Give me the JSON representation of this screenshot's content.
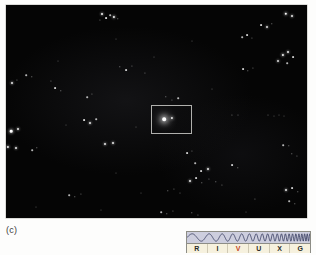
{
  "panel": {
    "label": "(c)",
    "caption_letter": "c"
  },
  "sky_image": {
    "background_color": "#050505",
    "frame_color": "#b9b9b4",
    "width": 301,
    "height": 213,
    "stars": [
      {
        "x": 96,
        "y": 9,
        "r": 1.0,
        "o": 0.95
      },
      {
        "x": 100,
        "y": 13,
        "r": 0.9,
        "o": 0.85
      },
      {
        "x": 104,
        "y": 10,
        "r": 0.8,
        "o": 0.7
      },
      {
        "x": 108,
        "y": 12,
        "r": 1.1,
        "o": 0.95
      },
      {
        "x": 112,
        "y": 14,
        "r": 0.7,
        "o": 0.6
      },
      {
        "x": 94,
        "y": 15,
        "r": 0.6,
        "o": 0.5
      },
      {
        "x": 280,
        "y": 9,
        "r": 1.2,
        "o": 1.0
      },
      {
        "x": 286,
        "y": 11,
        "r": 1.0,
        "o": 0.9
      },
      {
        "x": 255,
        "y": 20,
        "r": 0.9,
        "o": 0.8
      },
      {
        "x": 261,
        "y": 22,
        "r": 1.0,
        "o": 0.85
      },
      {
        "x": 266,
        "y": 19,
        "r": 0.7,
        "o": 0.6
      },
      {
        "x": 236,
        "y": 32,
        "r": 0.8,
        "o": 0.7
      },
      {
        "x": 241,
        "y": 30,
        "r": 0.9,
        "o": 0.8
      },
      {
        "x": 246,
        "y": 33,
        "r": 0.6,
        "o": 0.5
      },
      {
        "x": 277,
        "y": 50,
        "r": 1.1,
        "o": 0.95
      },
      {
        "x": 282,
        "y": 47,
        "r": 1.0,
        "o": 0.9
      },
      {
        "x": 287,
        "y": 52,
        "r": 0.9,
        "o": 0.8
      },
      {
        "x": 272,
        "y": 56,
        "r": 1.0,
        "o": 0.85
      },
      {
        "x": 281,
        "y": 58,
        "r": 0.8,
        "o": 0.7
      },
      {
        "x": 237,
        "y": 64,
        "r": 0.9,
        "o": 0.8
      },
      {
        "x": 242,
        "y": 66,
        "r": 0.7,
        "o": 0.6
      },
      {
        "x": 247,
        "y": 63,
        "r": 0.6,
        "o": 0.5
      },
      {
        "x": 110,
        "y": 34,
        "r": 0.5,
        "o": 0.4
      },
      {
        "x": 186,
        "y": 36,
        "r": 0.5,
        "o": 0.4
      },
      {
        "x": 6,
        "y": 78,
        "r": 1.0,
        "o": 0.9
      },
      {
        "x": 11,
        "y": 75,
        "r": 0.6,
        "o": 0.5
      },
      {
        "x": 20,
        "y": 70,
        "r": 0.8,
        "o": 0.7
      },
      {
        "x": 26,
        "y": 72,
        "r": 0.7,
        "o": 0.6
      },
      {
        "x": 45,
        "y": 76,
        "r": 0.6,
        "o": 0.5
      },
      {
        "x": 114,
        "y": 62,
        "r": 0.7,
        "o": 0.6
      },
      {
        "x": 120,
        "y": 65,
        "r": 0.9,
        "o": 0.8
      },
      {
        "x": 126,
        "y": 61,
        "r": 0.6,
        "o": 0.5
      },
      {
        "x": 139,
        "y": 68,
        "r": 0.6,
        "o": 0.5
      },
      {
        "x": 49,
        "y": 83,
        "r": 0.9,
        "o": 0.8
      },
      {
        "x": 55,
        "y": 86,
        "r": 0.7,
        "o": 0.6
      },
      {
        "x": 81,
        "y": 92,
        "r": 0.8,
        "o": 0.7
      },
      {
        "x": 86,
        "y": 89,
        "r": 0.6,
        "o": 0.5
      },
      {
        "x": 160,
        "y": 92,
        "r": 0.7,
        "o": 0.6
      },
      {
        "x": 166,
        "y": 95,
        "r": 0.6,
        "o": 0.5
      },
      {
        "x": 172,
        "y": 93,
        "r": 0.8,
        "o": 0.7
      },
      {
        "x": 226,
        "y": 110,
        "r": 0.6,
        "o": 0.5
      },
      {
        "x": 232,
        "y": 110,
        "r": 0.5,
        "o": 0.45
      },
      {
        "x": 262,
        "y": 110,
        "r": 0.5,
        "o": 0.45
      },
      {
        "x": 268,
        "y": 111,
        "r": 0.5,
        "o": 0.4
      },
      {
        "x": 273,
        "y": 110,
        "r": 0.5,
        "o": 0.4
      },
      {
        "x": 278,
        "y": 111,
        "r": 0.5,
        "o": 0.4
      },
      {
        "x": 78,
        "y": 115,
        "r": 0.9,
        "o": 0.85
      },
      {
        "x": 84,
        "y": 118,
        "r": 1.0,
        "o": 0.9
      },
      {
        "x": 90,
        "y": 114,
        "r": 0.8,
        "o": 0.7
      },
      {
        "x": 5,
        "y": 126,
        "r": 1.3,
        "o": 1.0
      },
      {
        "x": 12,
        "y": 124,
        "r": 1.0,
        "o": 0.9
      },
      {
        "x": 2,
        "y": 142,
        "r": 1.1,
        "o": 0.95
      },
      {
        "x": 10,
        "y": 143,
        "r": 1.0,
        "o": 0.9
      },
      {
        "x": 26,
        "y": 145,
        "r": 0.8,
        "o": 0.7
      },
      {
        "x": 31,
        "y": 143,
        "r": 0.7,
        "o": 0.6
      },
      {
        "x": 99,
        "y": 139,
        "r": 1.0,
        "o": 0.9
      },
      {
        "x": 107,
        "y": 138,
        "r": 1.0,
        "o": 0.9
      },
      {
        "x": 181,
        "y": 148,
        "r": 0.9,
        "o": 0.8
      },
      {
        "x": 186,
        "y": 146,
        "r": 0.6,
        "o": 0.5
      },
      {
        "x": 277,
        "y": 140,
        "r": 0.8,
        "o": 0.7
      },
      {
        "x": 283,
        "y": 141,
        "r": 0.7,
        "o": 0.6
      },
      {
        "x": 189,
        "y": 158,
        "r": 0.8,
        "o": 0.7
      },
      {
        "x": 110,
        "y": 168,
        "r": 0.5,
        "o": 0.4
      },
      {
        "x": 195,
        "y": 166,
        "r": 0.9,
        "o": 0.8
      },
      {
        "x": 202,
        "y": 164,
        "r": 1.0,
        "o": 0.9
      },
      {
        "x": 226,
        "y": 160,
        "r": 0.9,
        "o": 0.8
      },
      {
        "x": 232,
        "y": 163,
        "r": 0.7,
        "o": 0.6
      },
      {
        "x": 286,
        "y": 149,
        "r": 0.7,
        "o": 0.6
      },
      {
        "x": 291,
        "y": 151,
        "r": 0.6,
        "o": 0.5
      },
      {
        "x": 184,
        "y": 176,
        "r": 1.0,
        "o": 0.9
      },
      {
        "x": 190,
        "y": 173,
        "r": 0.9,
        "o": 0.8
      },
      {
        "x": 196,
        "y": 178,
        "r": 0.7,
        "o": 0.6
      },
      {
        "x": 203,
        "y": 174,
        "r": 0.6,
        "o": 0.5
      },
      {
        "x": 210,
        "y": 177,
        "r": 0.7,
        "o": 0.6
      },
      {
        "x": 216,
        "y": 180,
        "r": 0.6,
        "o": 0.5
      },
      {
        "x": 162,
        "y": 186,
        "r": 0.7,
        "o": 0.6
      },
      {
        "x": 168,
        "y": 184,
        "r": 0.6,
        "o": 0.5
      },
      {
        "x": 174,
        "y": 188,
        "r": 0.5,
        "o": 0.45
      },
      {
        "x": 63,
        "y": 190,
        "r": 0.8,
        "o": 0.7
      },
      {
        "x": 69,
        "y": 192,
        "r": 0.7,
        "o": 0.6
      },
      {
        "x": 75,
        "y": 189,
        "r": 0.6,
        "o": 0.5
      },
      {
        "x": 135,
        "y": 188,
        "r": 0.5,
        "o": 0.4
      },
      {
        "x": 249,
        "y": 194,
        "r": 0.6,
        "o": 0.5
      },
      {
        "x": 280,
        "y": 185,
        "r": 1.0,
        "o": 0.9
      },
      {
        "x": 286,
        "y": 183,
        "r": 0.9,
        "o": 0.8
      },
      {
        "x": 292,
        "y": 187,
        "r": 0.7,
        "o": 0.6
      },
      {
        "x": 283,
        "y": 196,
        "r": 0.8,
        "o": 0.7
      },
      {
        "x": 289,
        "y": 199,
        "r": 0.7,
        "o": 0.6
      },
      {
        "x": 155,
        "y": 207,
        "r": 0.8,
        "o": 0.7
      },
      {
        "x": 161,
        "y": 209,
        "r": 0.7,
        "o": 0.6
      },
      {
        "x": 167,
        "y": 206,
        "r": 0.6,
        "o": 0.5
      },
      {
        "x": 186,
        "y": 208,
        "r": 0.7,
        "o": 0.6
      },
      {
        "x": 192,
        "y": 210,
        "r": 0.6,
        "o": 0.5
      },
      {
        "x": 30,
        "y": 202,
        "r": 0.5,
        "o": 0.4
      },
      {
        "x": 95,
        "y": 205,
        "r": 0.5,
        "o": 0.4
      },
      {
        "x": 240,
        "y": 207,
        "r": 0.5,
        "o": 0.4
      },
      {
        "x": 52,
        "y": 56,
        "r": 0.5,
        "o": 0.4
      },
      {
        "x": 148,
        "y": 52,
        "r": 0.5,
        "o": 0.4
      },
      {
        "x": 206,
        "y": 84,
        "r": 0.5,
        "o": 0.4
      },
      {
        "x": 60,
        "y": 120,
        "r": 0.5,
        "o": 0.4
      },
      {
        "x": 130,
        "y": 122,
        "r": 0.5,
        "o": 0.4
      }
    ],
    "inset_sources": [
      {
        "x": 158,
        "y": 114,
        "r": 1.8,
        "o": 1.0,
        "glow": true
      },
      {
        "x": 166,
        "y": 113,
        "r": 1.1,
        "o": 0.9,
        "glow": false
      }
    ]
  },
  "highlight_box": {
    "left": 151,
    "top": 105,
    "width": 41,
    "height": 29,
    "border_color": "#b0b0ad"
  },
  "spectrum_legend": {
    "wave_band_color": "#cdcede",
    "wave_color": "#2a2f55",
    "label_strip_color": "#f6f1de",
    "border_color": "#8d8d86",
    "highlight_color": "#c4441c",
    "bands": [
      {
        "code": "R",
        "name": "radio",
        "highlighted": false
      },
      {
        "code": "I",
        "name": "infrared",
        "highlighted": false
      },
      {
        "code": "V",
        "name": "visible",
        "highlighted": true
      },
      {
        "code": "U",
        "name": "ultraviolet",
        "highlighted": false
      },
      {
        "code": "X",
        "name": "x-ray",
        "highlighted": false
      },
      {
        "code": "G",
        "name": "gamma-ray",
        "highlighted": false
      }
    ]
  }
}
